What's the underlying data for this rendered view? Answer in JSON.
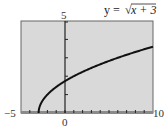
{
  "chart_data": {
    "type": "line",
    "title_parts": {
      "prefix": "y = ",
      "radicand": "x + 3"
    },
    "function": "sqrt(x+3)",
    "xlim": [
      -5,
      10
    ],
    "ylim": [
      0,
      5
    ],
    "xscale": 1,
    "yscale": 1,
    "grid": false,
    "axis_labels": {
      "xmin": "−5",
      "xmax": "10",
      "ymax": "5",
      "origin_x": "0"
    },
    "series": [
      {
        "name": "y = √(x+3)",
        "x": [
          -3,
          -2.75,
          -2,
          -1,
          0,
          1,
          2,
          4,
          6,
          8,
          10
        ],
        "y": [
          0,
          0.5,
          1,
          1.414,
          1.732,
          2,
          2.236,
          2.646,
          3,
          3.317,
          3.606
        ]
      }
    ],
    "colors": {
      "plot_bg": "#d9d9d9",
      "curve": "#111111",
      "axis": "#222222",
      "frame": "#555555"
    }
  }
}
